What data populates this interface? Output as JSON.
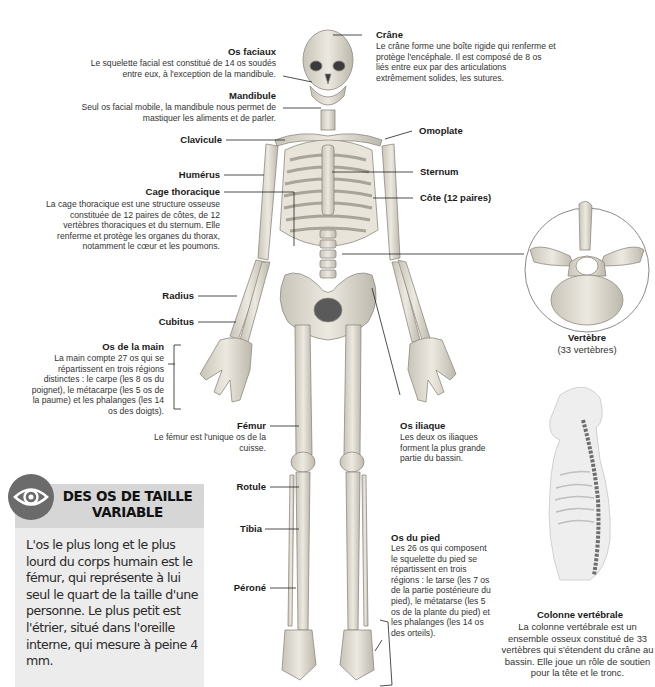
{
  "labels": {
    "crane": {
      "title": "Crâne",
      "text": "Le crâne forme une boîte rigide qui renferme et protège l'encéphale. Il est composé de 8 os liés entre eux par des articulations extrêmement solides, les sutures."
    },
    "os_faciaux": {
      "title": "Os faciaux",
      "text": "Le squelette facial est constitué de 14 os soudés entre eux, à l'exception de la mandibule."
    },
    "mandibule": {
      "title": "Mandibule",
      "text": "Seul os facial mobile, la mandibule nous permet de mastiquer les aliments et de parler."
    },
    "clavicule": {
      "title": "Clavicule"
    },
    "omoplate": {
      "title": "Omoplate"
    },
    "humerus": {
      "title": "Humérus"
    },
    "sternum": {
      "title": "Sternum"
    },
    "cote": {
      "title": "Côte (12 paires)"
    },
    "cage_thoracique": {
      "title": "Cage thoracique",
      "text": "La cage thoracique est une structure osseuse constituée de 12 paires de côtes, de 12 vertèbres thoraciques et du sternum. Elle renferme et protège les organes du thorax, notamment le cœur et les poumons."
    },
    "radius": {
      "title": "Radius"
    },
    "cubitus": {
      "title": "Cubitus"
    },
    "os_main": {
      "title": "Os de la main",
      "text": "La main compte 27 os qui se répartissent en trois régions distinctes : le carpe (les 8 os du poignet), le métacarpe (les 5 os de la paume) et les phalanges (les 14 os des doigts)."
    },
    "vertebre": {
      "title": "Vertèbre",
      "text": "(33 vertèbres)"
    },
    "os_iliaque": {
      "title": "Os iliaque",
      "text": "Les deux os iliaques forment la plus grande partie du bassin."
    },
    "femur": {
      "title": "Fémur",
      "text": "Le fémur est l'unique os de la cuisse."
    },
    "rotule": {
      "title": "Rotule"
    },
    "tibia": {
      "title": "Tibia"
    },
    "perone": {
      "title": "Péroné"
    },
    "os_pied": {
      "title": "Os du pied",
      "text": "Les 26 os qui composent le squelette du pied se répartissent en trois régions : le tarse (les 7 os de la partie postérieure du pied), le métatarse (les 5 os de la plante du pied) et les phalanges (les 14 os des orteils)."
    },
    "colonne": {
      "title": "Colonne vertébrale",
      "text": "La colonne vertébrale est un ensemble osseux constitué de 33 vertèbres qui s'étendent du crâne au bassin. Elle joue un rôle de soutien pour la tête et le tronc."
    }
  },
  "infobox": {
    "icon": "eye-icon",
    "title": "DES OS DE TAILLE VARIABLE",
    "text": "L'os le plus long et le plus lourd du corps humain est le fémur, qui représente à lui seul le quart de la taille d'une personne. Le plus petit est l'étrier, situé dans l'oreille interne, qui mesure à peine 4 mm."
  },
  "colors": {
    "bone": "#e6e2d8",
    "bone_shadow": "#b9b4a8",
    "infobox_bg": "#ececec",
    "infobox_header": "#d6d6d6",
    "eye_icon": "#6b6b6b",
    "leader_line": "#222222"
  }
}
